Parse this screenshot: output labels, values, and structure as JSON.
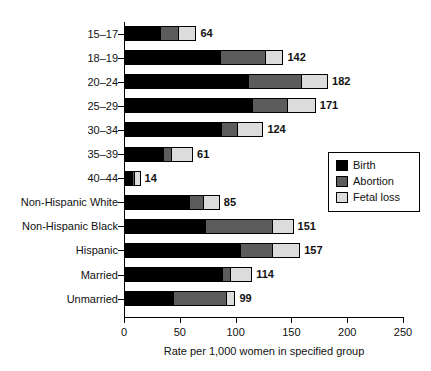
{
  "chart_data": {
    "type": "bar",
    "orientation": "horizontal",
    "stacked": true,
    "title": "",
    "xlabel": "Rate per 1,000 women in specified group",
    "ylabel": "",
    "xlim": [
      0,
      250
    ],
    "xticks": [
      0,
      50,
      100,
      150,
      200,
      250
    ],
    "xtick_labels": [
      "0",
      "50",
      "100",
      "150",
      "200",
      "250"
    ],
    "grid": false,
    "legend_position": "center-right-inside",
    "categories": [
      "15–17",
      "18–19",
      "20–24",
      "25–29",
      "30–34",
      "35–39",
      "40–44",
      "Non-Hispanic White",
      "Non-Hispanic Black",
      "Hispanic",
      "Married",
      "Unmarried"
    ],
    "series": [
      {
        "name": "Birth",
        "color": "#000000",
        "values": [
          32,
          86,
          111,
          115,
          87,
          35,
          7,
          58,
          73,
          104,
          88,
          44
        ]
      },
      {
        "name": "Abortion",
        "color": "#5c5c5c",
        "values": [
          16,
          40,
          48,
          31,
          14,
          7,
          2,
          13,
          60,
          29,
          7,
          47
        ]
      },
      {
        "name": "Fetal loss",
        "color": "#dcdcdc",
        "values": [
          16,
          16,
          23,
          25,
          23,
          19,
          5,
          14,
          18,
          24,
          19,
          8
        ]
      }
    ],
    "totals": [
      64,
      142,
      182,
      171,
      124,
      61,
      14,
      85,
      151,
      157,
      114,
      99
    ],
    "total_labels": [
      "64",
      "142",
      "182",
      "171",
      "124",
      "61",
      "14",
      "85",
      "151",
      "157",
      "114",
      "99"
    ],
    "legend": [
      {
        "label": "Birth",
        "color": "#000000"
      },
      {
        "label": "Abortion",
        "color": "#5c5c5c"
      },
      {
        "label": "Fetal loss",
        "color": "#dcdcdc"
      }
    ]
  }
}
